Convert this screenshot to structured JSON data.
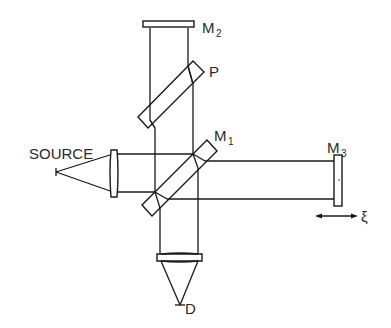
{
  "labels": {
    "source": "SOURCE",
    "m1": "M",
    "m1_sub": "1",
    "m2": "M",
    "m2_sub": "2",
    "m3": "M",
    "m3_sub": "3",
    "p": "P",
    "d": "D",
    "xi": "ξ"
  },
  "colors": {
    "line": "#1a1a1a",
    "text": "#2a2a2a",
    "background": "#ffffff"
  }
}
